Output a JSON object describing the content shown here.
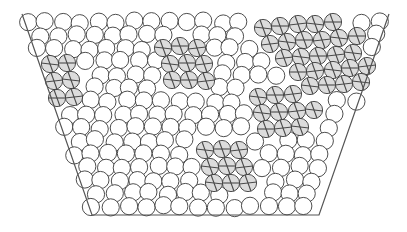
{
  "diagram": {
    "title": "",
    "width": 407,
    "height": 232,
    "colors": {
      "background": "#ffffff",
      "grain_fill": "#ffffff",
      "grain_stroke": "#3a3a3a",
      "shaded_fill": "#dcdcdc",
      "hatch_stroke": "#4a4a4a",
      "container_stroke": "#555555"
    },
    "container": {
      "shape": "open-top trapezoid",
      "top_left": [
        22,
        14
      ],
      "bottom_left": [
        92,
        215
      ],
      "bottom_right": [
        319,
        215
      ],
      "top_right": [
        389,
        14
      ]
    },
    "grain_radius": 8.6,
    "packing": {
      "row_spacing": 13.2,
      "col_spacing": 17.6,
      "first_row_y": 22,
      "last_row_y": 207,
      "jitter": 1.6
    },
    "shaded_clusters": [
      {
        "name": "left-cluster",
        "grains": [
          [
            50,
            64
          ],
          [
            67,
            63
          ],
          [
            54,
            81
          ],
          [
            71,
            80
          ],
          [
            57,
            98
          ],
          [
            74,
            97
          ]
        ]
      },
      {
        "name": "upper-center-cluster",
        "grains": [
          [
            163,
            48
          ],
          [
            180,
            46
          ],
          [
            197,
            48
          ],
          [
            170,
            64
          ],
          [
            187,
            63
          ],
          [
            204,
            64
          ],
          [
            172,
            80
          ],
          [
            189,
            80
          ],
          [
            206,
            81
          ]
        ]
      },
      {
        "name": "upper-right-cluster",
        "grains": [
          [
            263,
            28
          ],
          [
            280,
            26
          ],
          [
            298,
            24
          ],
          [
            315,
            24
          ],
          [
            333,
            22
          ],
          [
            270,
            44
          ],
          [
            287,
            42
          ],
          [
            304,
            40
          ],
          [
            322,
            40
          ],
          [
            339,
            38
          ],
          [
            357,
            36
          ],
          [
            284,
            58
          ],
          [
            301,
            57
          ],
          [
            318,
            56
          ],
          [
            336,
            55
          ],
          [
            353,
            53
          ],
          [
            298,
            72
          ],
          [
            315,
            71
          ],
          [
            333,
            70
          ],
          [
            350,
            68
          ],
          [
            367,
            66
          ],
          [
            310,
            86
          ],
          [
            327,
            85
          ],
          [
            344,
            84
          ],
          [
            361,
            82
          ]
        ]
      },
      {
        "name": "middle-right-cluster",
        "grains": [
          [
            258,
            97
          ],
          [
            275,
            95
          ],
          [
            293,
            94
          ],
          [
            262,
            113
          ],
          [
            279,
            112
          ],
          [
            297,
            111
          ],
          [
            314,
            110
          ],
          [
            266,
            129
          ],
          [
            283,
            128
          ],
          [
            300,
            127
          ]
        ]
      },
      {
        "name": "lower-center-cluster",
        "grains": [
          [
            205,
            150
          ],
          [
            222,
            149
          ],
          [
            239,
            150
          ],
          [
            210,
            167
          ],
          [
            227,
            166
          ],
          [
            244,
            167
          ],
          [
            214,
            183
          ],
          [
            231,
            183
          ],
          [
            248,
            183
          ]
        ]
      }
    ]
  }
}
